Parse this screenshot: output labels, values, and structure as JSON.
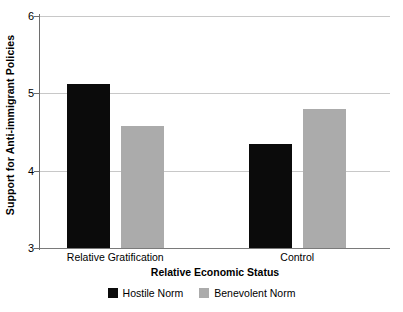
{
  "chart_data": {
    "type": "bar",
    "title": "",
    "xlabel": "Relative Economic Status",
    "ylabel": "Support for Anti-immigrant Policies",
    "categories": [
      "Relative Gratification",
      "Control"
    ],
    "series": [
      {
        "name": "Hostile Norm",
        "color": "#0b0b0b",
        "values": [
          5.12,
          4.35
        ]
      },
      {
        "name": "Benevolent Norm",
        "color": "#ababab",
        "values": [
          4.58,
          4.8
        ]
      }
    ],
    "ylim": [
      3,
      6
    ],
    "yticks": [
      "3",
      "4",
      "5",
      "6"
    ],
    "ytick_values": [
      3,
      4,
      5,
      6
    ],
    "grid": true,
    "legend_position": "bottom",
    "legend_entries": [
      "Hostile Norm",
      "Benevolent Norm"
    ]
  }
}
